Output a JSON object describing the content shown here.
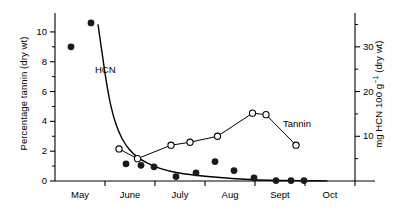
{
  "chart_data": {
    "type": "line",
    "title": "",
    "xlabel": "",
    "ylabel": "Percentage tannin (dry wt)",
    "y2label": "mg HCN 100 g⁻¹ (dry wt)",
    "grid": false,
    "legend_position": "inline-annotation",
    "xlim": [
      0,
      6
    ],
    "ylim": [
      0,
      11
    ],
    "y2lim": [
      0,
      36.67
    ],
    "x_tick_labels": [
      "May",
      "June",
      "July",
      "Aug",
      "Sept",
      "Oct"
    ],
    "x_tick_positions": [
      0.5,
      1.5,
      2.5,
      3.5,
      4.5,
      5.5
    ],
    "x_boundary_ticks": [
      0,
      1,
      2,
      3,
      4,
      5,
      6
    ],
    "y_left_ticks": [
      0,
      2,
      4,
      6,
      8,
      10
    ],
    "y_left_minor_ticks": [
      1,
      3,
      5,
      7,
      9
    ],
    "y_right_ticks": [
      10,
      20,
      30
    ],
    "y_right_minor_ticks": [
      5,
      15,
      25,
      35
    ],
    "series": [
      {
        "name": "HCN",
        "label": "HCN",
        "marker": "filled-circle",
        "axis": "right",
        "line": "smooth-curve",
        "points": [
          {
            "x": 0.32,
            "y_left": 9.0,
            "y_right": 30.0
          },
          {
            "x": 0.72,
            "y_left": 10.6,
            "y_right": 35.3
          },
          {
            "x": 1.42,
            "y_left": 1.15,
            "y_right": 3.8
          },
          {
            "x": 1.72,
            "y_left": 1.05,
            "y_right": 3.5
          },
          {
            "x": 1.98,
            "y_left": 0.95,
            "y_right": 3.2
          },
          {
            "x": 2.42,
            "y_left": 0.3,
            "y_right": 1.0
          },
          {
            "x": 2.82,
            "y_left": 0.55,
            "y_right": 1.8
          },
          {
            "x": 3.2,
            "y_left": 1.3,
            "y_right": 4.3
          },
          {
            "x": 3.58,
            "y_left": 0.7,
            "y_right": 2.3
          },
          {
            "x": 3.98,
            "y_left": 0.2,
            "y_right": 0.7
          },
          {
            "x": 4.42,
            "y_left": 0.03,
            "y_right": 0.1
          },
          {
            "x": 4.72,
            "y_left": 0.03,
            "y_right": 0.1
          },
          {
            "x": 4.98,
            "y_left": 0.03,
            "y_right": 0.1
          }
        ],
        "curve_points": [
          {
            "x": 0.86,
            "y_left": 10.5
          },
          {
            "x": 0.95,
            "y_left": 8.4
          },
          {
            "x": 1.03,
            "y_left": 6.6
          },
          {
            "x": 1.12,
            "y_left": 5.0
          },
          {
            "x": 1.22,
            "y_left": 3.8
          },
          {
            "x": 1.34,
            "y_left": 2.85
          },
          {
            "x": 1.48,
            "y_left": 2.15
          },
          {
            "x": 1.65,
            "y_left": 1.6
          },
          {
            "x": 1.85,
            "y_left": 1.2
          },
          {
            "x": 2.1,
            "y_left": 0.85
          },
          {
            "x": 2.45,
            "y_left": 0.55
          },
          {
            "x": 2.85,
            "y_left": 0.37
          },
          {
            "x": 3.3,
            "y_left": 0.23
          },
          {
            "x": 3.8,
            "y_left": 0.12
          },
          {
            "x": 4.3,
            "y_left": 0.05
          },
          {
            "x": 4.9,
            "y_left": 0.02
          },
          {
            "x": 5.45,
            "y_left": 0.01
          }
        ]
      },
      {
        "name": "Tannin",
        "label": "Tannin",
        "marker": "open-circle",
        "axis": "left",
        "line": "straight-segments",
        "points": [
          {
            "x": 1.28,
            "y_left": 2.15
          },
          {
            "x": 1.65,
            "y_left": 1.5
          },
          {
            "x": 2.32,
            "y_left": 2.4
          },
          {
            "x": 2.7,
            "y_left": 2.6
          },
          {
            "x": 3.25,
            "y_left": 3.0
          },
          {
            "x": 3.95,
            "y_left": 4.55
          },
          {
            "x": 4.22,
            "y_left": 4.45
          },
          {
            "x": 4.82,
            "y_left": 2.4
          }
        ]
      }
    ],
    "annotations": [
      {
        "text": "HCN",
        "x_px": 95,
        "y_px": 64
      },
      {
        "text": "Tannin",
        "x_px": 283,
        "y_px": 118
      }
    ],
    "colors": {
      "axis": "#000000",
      "hcn_marker": "#1a1a1a",
      "tannin_marker_fill": "#ffffff",
      "tannin_marker_stroke": "#000000",
      "curve": "#000000",
      "background": "#ffffff"
    }
  }
}
